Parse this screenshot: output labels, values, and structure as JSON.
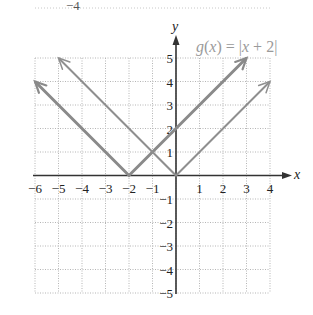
{
  "top_fragment": {
    "text": "−4"
  },
  "chart_data": {
    "type": "line",
    "title": "g(x) = |x + 2|",
    "xlabel": "x",
    "ylabel": "y",
    "xlim": [
      -6,
      4
    ],
    "ylim": [
      -5,
      5
    ],
    "grid": true,
    "x_ticks": [
      -6,
      -5,
      -4,
      -3,
      -2,
      -1,
      1,
      2,
      3,
      4
    ],
    "y_ticks": [
      5,
      4,
      3,
      2,
      1,
      -1,
      -2,
      -3,
      -4,
      -5
    ],
    "x_tick_labels": [
      "−6",
      "−5",
      "−4",
      "−3",
      "−2",
      "−1",
      "1",
      "2",
      "3",
      "4"
    ],
    "y_tick_labels": [
      "5",
      "4",
      "3",
      "2",
      "1",
      "−1",
      "−2",
      "−3",
      "−4",
      "−5"
    ],
    "series": [
      {
        "name": "g(x) = |x + 2|",
        "points": [
          [
            -6,
            4
          ],
          [
            -2,
            0
          ],
          [
            3,
            5
          ]
        ],
        "color": "#8a8a8a",
        "width": 3
      },
      {
        "name": "f(x) = |x|",
        "points": [
          [
            -5,
            5
          ],
          [
            0,
            0
          ],
          [
            4,
            4
          ]
        ],
        "color": "#8f8f8f",
        "width": 2
      }
    ],
    "annotations": [
      {
        "text": "g(x) = |x + 2|",
        "position": "top-right"
      }
    ]
  },
  "labels": {
    "fn_g": "g",
    "fn_paren_open": "(",
    "fn_x": "x",
    "fn_mid": ") = |",
    "fn_x2": "x",
    "fn_end": " + 2|",
    "x_axis": "x",
    "y_axis": "y"
  },
  "colors": {
    "axis": "#333333",
    "grid": "#b5b5b5",
    "line_g": "#8a8a8a",
    "line_f": "#8f8f8f",
    "label": "#9a9a9a"
  }
}
